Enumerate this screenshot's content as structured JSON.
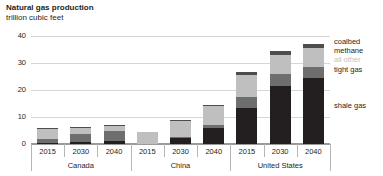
{
  "header": {
    "title": "Natural gas production",
    "subtitle": "trillion cubic feet"
  },
  "legend": {
    "items": [
      {
        "label": "coalbed",
        "color": "#4d4d4d"
      },
      {
        "label": "methane",
        "color": "#4d4d4d"
      },
      {
        "label": "all other",
        "color": "#bfbfbf"
      },
      {
        "label": "tight gas",
        "color": "#6e6e6e"
      },
      {
        "label": "shale gas",
        "color": "#231f20"
      }
    ]
  },
  "axis": {
    "y_ticks": [
      "0",
      "10",
      "20",
      "30",
      "40"
    ],
    "x_ticks": [
      "2015",
      "2030",
      "2040",
      "2015",
      "2030",
      "2040",
      "2015",
      "2030",
      "2040"
    ],
    "groups": [
      "Canada",
      "China",
      "United States"
    ]
  },
  "chart_data": {
    "type": "bar",
    "stacked": true,
    "title": "Natural gas production",
    "subtitle": "trillion cubic feet",
    "xlabel": "",
    "ylabel": "trillion cubic feet",
    "ylim": [
      0,
      40
    ],
    "yticks": [
      0,
      10,
      20,
      30,
      40
    ],
    "grid": true,
    "legend_position": "right",
    "groups": [
      "Canada",
      "China",
      "United States"
    ],
    "categories": [
      "Canada 2015",
      "Canada 2030",
      "Canada 2040",
      "China 2015",
      "China 2030",
      "China 2040",
      "United States 2015",
      "United States 2030",
      "United States 2040"
    ],
    "series": [
      {
        "name": "shale gas",
        "color": "#231f20",
        "values": [
          0.4,
          0.8,
          1.2,
          0.0,
          2.3,
          6.0,
          13.3,
          21.6,
          24.7
        ]
      },
      {
        "name": "tight gas",
        "color": "#6e6e6e",
        "values": [
          1.4,
          2.8,
          3.7,
          0.0,
          0.4,
          1.1,
          4.4,
          4.4,
          4.1
        ]
      },
      {
        "name": "all other",
        "color": "#bfbfbf",
        "values": [
          3.7,
          2.4,
          1.9,
          4.5,
          6.0,
          7.0,
          8.1,
          7.4,
          7.0
        ]
      },
      {
        "name": "coalbed methane",
        "color": "#4d4d4d",
        "values": [
          0.5,
          0.4,
          0.3,
          0.0,
          0.4,
          0.5,
          1.2,
          1.5,
          1.6
        ]
      }
    ],
    "totals": [
      6.0,
      6.4,
      7.1,
      4.5,
      9.1,
      14.6,
      27.0,
      34.9,
      37.4
    ]
  }
}
